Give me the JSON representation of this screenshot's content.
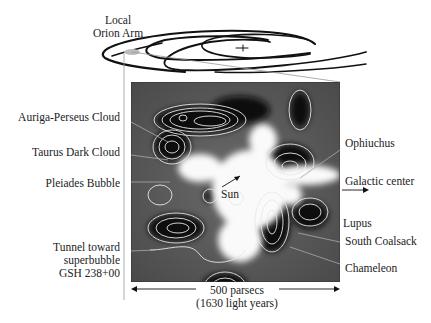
{
  "diagram": {
    "title_label": [
      "Local",
      "Orion Arm"
    ],
    "left_labels": [
      {
        "text": "Auriga-Perseus Cloud"
      },
      {
        "text": "Taurus Dark Cloud"
      },
      {
        "text": "Pleiades Bubble"
      },
      {
        "text": "Tunnel toward",
        "line2": "superbubble",
        "line3": "GSH 238+00"
      }
    ],
    "right_labels": [
      {
        "text": "Ophiuchus"
      },
      {
        "text": "Galactic center"
      },
      {
        "text": "Lupus"
      },
      {
        "text": "South Coalsack"
      },
      {
        "text": "Chameleon"
      }
    ],
    "center_label": "Sun",
    "scale": {
      "line1": "500 parsecs",
      "line2": "(1630 light years)"
    },
    "colors": {
      "background": "#ffffff",
      "map_dark": "#111111",
      "map_mid": "#555555",
      "contour": "#e8e8e8",
      "text": "#222222"
    }
  }
}
